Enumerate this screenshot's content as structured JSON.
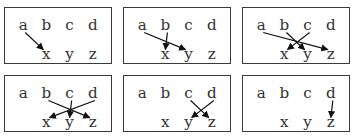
{
  "diagram": {
    "top_labels": [
      "a",
      "b",
      "c",
      "d"
    ],
    "bottom_labels": [
      "x",
      "y",
      "z"
    ],
    "panels": [
      {
        "id": 1,
        "arrows": [
          {
            "from": "a",
            "to": "x"
          }
        ]
      },
      {
        "id": 2,
        "arrows": [
          {
            "from": "a",
            "to": "y"
          },
          {
            "from": "b",
            "to": "x"
          }
        ]
      },
      {
        "id": 3,
        "arrows": [
          {
            "from": "a",
            "to": "z"
          },
          {
            "from": "b",
            "to": "y"
          },
          {
            "from": "c",
            "to": "x"
          }
        ]
      },
      {
        "id": 4,
        "arrows": [
          {
            "from": "b",
            "to": "z"
          },
          {
            "from": "c",
            "to": "y"
          },
          {
            "from": "d",
            "to": "x"
          }
        ]
      },
      {
        "id": 5,
        "arrows": [
          {
            "from": "c",
            "to": "z"
          },
          {
            "from": "d",
            "to": "y"
          }
        ]
      },
      {
        "id": 6,
        "arrows": [
          {
            "from": "d",
            "to": "z"
          }
        ]
      }
    ]
  }
}
